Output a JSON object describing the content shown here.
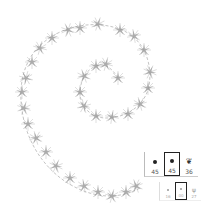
{
  "canvas": {
    "stroke_color": "#9a9a9a",
    "description": "spiral brush stroke with scattered star-like brush tips"
  },
  "brush_presets": {
    "row1": [
      {
        "icon": "round-brush-icon",
        "size": "45",
        "selected": false
      },
      {
        "icon": "round-brush-icon",
        "size": "45",
        "selected": true
      },
      {
        "icon": "leaf-scatter-brush-icon",
        "size": "36",
        "selected": false
      }
    ],
    "row2": [
      {
        "icon": "round-brush-icon",
        "size": "16",
        "selected": false
      },
      {
        "icon": "round-brush-icon",
        "size": "00",
        "selected": true
      },
      {
        "icon": "grass-brush-icon",
        "size": "27",
        "selected": false
      }
    ]
  }
}
